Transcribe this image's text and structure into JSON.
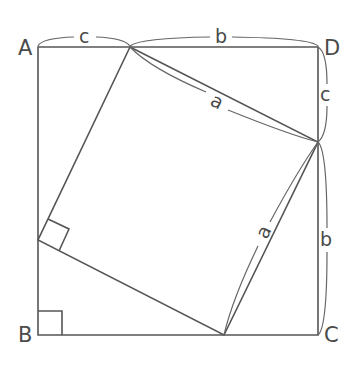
{
  "diagram": {
    "stroke_color": "#555555",
    "vertices": {
      "A": "A",
      "B": "B",
      "C": "C",
      "D": "D"
    },
    "side_labels": {
      "top_left": "c",
      "top_right": "b",
      "right_upper": "c",
      "right_lower": "b",
      "inner_upper": "a",
      "inner_lower": "a"
    },
    "geometry": {
      "outer_square": {
        "A": [
          38,
          47
        ],
        "D": [
          318,
          47
        ],
        "C": [
          318,
          335
        ],
        "B": [
          38,
          335
        ]
      },
      "inner_square": [
        [
          130,
          47
        ],
        [
          318,
          142
        ],
        [
          224,
          335
        ],
        [
          38,
          240
        ]
      ],
      "right_angle_marks": [
        "B",
        "inner-left-vertex"
      ]
    }
  }
}
